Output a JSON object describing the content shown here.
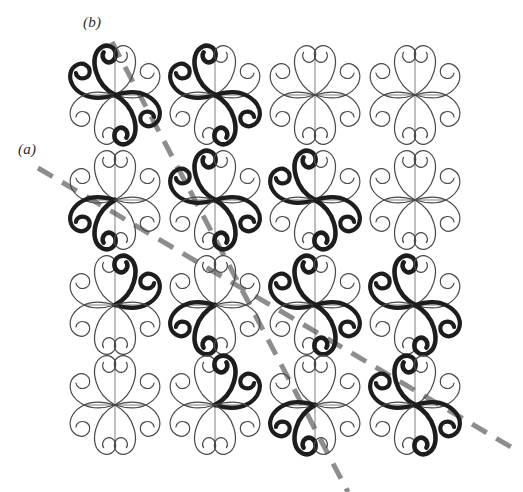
{
  "figure": {
    "kind": "ornament-lattice-figure",
    "background_color": "#ffffff",
    "ink_color": "#1d1d1d",
    "faint_ink_color": "#4a4a4a",
    "dash_color": "#8d8d8d",
    "width": 523,
    "height": 492
  },
  "labels": [
    {
      "id": "b",
      "text": "(b)",
      "x": 83,
      "y": 14
    },
    {
      "id": "a",
      "text": "(a)",
      "x": 18,
      "y": 141
    }
  ],
  "grid": {
    "rows": 4,
    "cols": 4,
    "col_centers": [
      115,
      215,
      315,
      415
    ],
    "row_centers": [
      95,
      200,
      305,
      405
    ],
    "motif_name": "fleuron-four-spiral-arms",
    "cells": [
      {
        "row": 0,
        "col": 0,
        "cx": 115,
        "cy": 95,
        "bold_arms": [
          "upper-left",
          "lower-right"
        ],
        "emphasis": "vertical",
        "dark": true
      },
      {
        "row": 0,
        "col": 1,
        "cx": 215,
        "cy": 95,
        "bold_arms": [
          "upper-left",
          "lower-right"
        ],
        "emphasis": "horizontal",
        "dark": true
      },
      {
        "row": 0,
        "col": 2,
        "cx": 315,
        "cy": 95,
        "bold_arms": [],
        "emphasis": "none",
        "dark": false
      },
      {
        "row": 0,
        "col": 3,
        "cx": 415,
        "cy": 95,
        "bold_arms": [],
        "emphasis": "none",
        "dark": false
      },
      {
        "row": 1,
        "col": 0,
        "cx": 115,
        "cy": 200,
        "bold_arms": [
          "lower-left"
        ],
        "emphasis": "single",
        "dark": true
      },
      {
        "row": 1,
        "col": 1,
        "cx": 215,
        "cy": 200,
        "bold_arms": [
          "upper-left",
          "lower-right"
        ],
        "emphasis": "vertical",
        "dark": true
      },
      {
        "row": 1,
        "col": 2,
        "cx": 315,
        "cy": 200,
        "bold_arms": [
          "upper-left",
          "lower-right"
        ],
        "emphasis": "horizontal",
        "dark": true
      },
      {
        "row": 1,
        "col": 3,
        "cx": 415,
        "cy": 200,
        "bold_arms": [],
        "emphasis": "none",
        "dark": false
      },
      {
        "row": 2,
        "col": 0,
        "cx": 115,
        "cy": 305,
        "bold_arms": [
          "upper-right"
        ],
        "emphasis": "single",
        "dark": true
      },
      {
        "row": 2,
        "col": 1,
        "cx": 215,
        "cy": 305,
        "bold_arms": [
          "lower-left"
        ],
        "emphasis": "single",
        "dark": true
      },
      {
        "row": 2,
        "col": 2,
        "cx": 315,
        "cy": 305,
        "bold_arms": [
          "upper-left",
          "lower-right"
        ],
        "emphasis": "vertical",
        "dark": true
      },
      {
        "row": 2,
        "col": 3,
        "cx": 415,
        "cy": 305,
        "bold_arms": [
          "upper-left",
          "lower-right"
        ],
        "emphasis": "horizontal",
        "dark": true
      },
      {
        "row": 3,
        "col": 0,
        "cx": 115,
        "cy": 405,
        "bold_arms": [],
        "emphasis": "none",
        "dark": false
      },
      {
        "row": 3,
        "col": 1,
        "cx": 215,
        "cy": 405,
        "bold_arms": [
          "upper-right"
        ],
        "emphasis": "single",
        "dark": true
      },
      {
        "row": 3,
        "col": 2,
        "cx": 315,
        "cy": 405,
        "bold_arms": [
          "lower-left"
        ],
        "emphasis": "single",
        "dark": true
      },
      {
        "row": 3,
        "col": 3,
        "cx": 415,
        "cy": 405,
        "bold_arms": [
          "upper-left",
          "lower-right"
        ],
        "emphasis": "vertical",
        "dark": true
      }
    ]
  },
  "dashed_lines": [
    {
      "id": "b",
      "label": "(b)",
      "x1": 112,
      "y1": 42,
      "x2": 348,
      "y2": 492,
      "color": "#8d8d8d",
      "width": 5,
      "dash": "17 11"
    },
    {
      "id": "a",
      "label": "(a)",
      "x1": 38,
      "y1": 168,
      "x2": 516,
      "y2": 450,
      "color": "#8d8d8d",
      "width": 5,
      "dash": "17 11"
    }
  ]
}
